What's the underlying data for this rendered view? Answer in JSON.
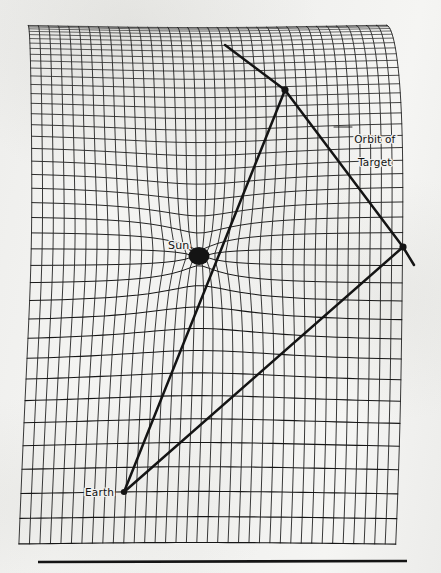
{
  "figure": {
    "kind": "spacetime-curvature-parallax-diagram",
    "background_color": "#f2f2f0",
    "ink_color": "#141414",
    "canvas": {
      "width": 441,
      "height": 573
    }
  },
  "labels": {
    "sun": "Sun",
    "earth": "Earth",
    "orbit_of_target_line1": "Orbit of",
    "orbit_of_target_line2": "Target"
  },
  "bodies": [
    {
      "name": "sun",
      "label": "Sun",
      "x": 199,
      "y": 256,
      "rx": 10.5,
      "ry": 9.0,
      "shape": "filled-ellipse"
    },
    {
      "name": "earth",
      "label": "Earth",
      "x": 124,
      "y": 492,
      "rx": 3.2,
      "ry": 3.0,
      "shape": "filled-dot"
    },
    {
      "name": "target-position-1",
      "label": "",
      "x": 285,
      "y": 90,
      "rx": 3.6,
      "ry": 3.4,
      "shape": "filled-dot"
    },
    {
      "name": "target-position-2",
      "label": "",
      "x": 403,
      "y": 247,
      "rx": 3.6,
      "ry": 3.4,
      "shape": "filled-dot"
    }
  ],
  "sight_lines": [
    {
      "name": "earth-to-target-1-through-sun",
      "from": [
        124,
        492
      ],
      "to": [
        285,
        90
      ],
      "width": 2.5
    },
    {
      "name": "earth-to-target-2",
      "from": [
        124,
        492
      ],
      "to": [
        403,
        247
      ],
      "width": 2.5
    }
  ],
  "orbit_path": {
    "name": "orbit-of-target",
    "width": 2.5,
    "points": [
      [
        225,
        45
      ],
      [
        285,
        90
      ],
      [
        403,
        247
      ],
      [
        414,
        265
      ]
    ]
  },
  "sun_leader_line": {
    "from": [
      188,
      249
    ],
    "to": [
      196,
      253
    ],
    "width": 1.1
  },
  "orbit_label_leader": {
    "from": [
      334,
      127
    ],
    "to": [
      352,
      127
    ],
    "width": 0.9
  },
  "grid": {
    "name": "warped-spacetime-grid",
    "rect": {
      "left": 22,
      "top": 21,
      "right": 412,
      "bottom": 548
    },
    "columns": 36,
    "rows": 40,
    "perspective_power": 1.95,
    "shear_top": 0.055,
    "shear_bottom": -0.055,
    "line_color": "#161616",
    "stroke_min": 0.55,
    "stroke_max": 1.15,
    "well": {
      "center_x": 199,
      "center_y": 256,
      "strength": 1250,
      "softening": 26,
      "vertical_bias": 1.45,
      "max_pull": 62
    }
  },
  "bottom_rule": {
    "name": "bottom-rule",
    "x1": 38,
    "y1": 562,
    "x2": 407,
    "y2": 561,
    "width": 2.6
  }
}
